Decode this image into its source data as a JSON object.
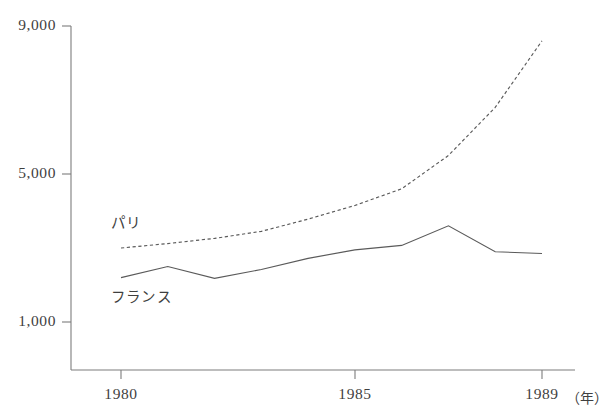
{
  "chart_data": {
    "type": "line",
    "title": "",
    "xlabel": "（年）",
    "ylabel": "",
    "x": [
      1980,
      1981,
      1982,
      1983,
      1984,
      1985,
      1986,
      1987,
      1988,
      1989
    ],
    "xlim": [
      1979.0,
      1990.0
    ],
    "ylim": [
      0,
      9000
    ],
    "yticks": [
      1000,
      5000,
      9000
    ],
    "ytick_labels": [
      "1,000",
      "5,000",
      "9,000"
    ],
    "xticks": [
      1980,
      1985,
      1989
    ],
    "xtick_labels": [
      "1980",
      "1985",
      "1989"
    ],
    "grid": false,
    "legend_position": "inline-annotations",
    "series": [
      {
        "name": "パリ",
        "style": "dashed",
        "color": "#5a5a5a",
        "label_annotation": "パリ",
        "values": [
          3000,
          3120,
          3260,
          3450,
          3780,
          4150,
          4600,
          5500,
          6800,
          8600
        ]
      },
      {
        "name": "フランス",
        "style": "solid",
        "color": "#5a5a5a",
        "label_annotation": "フランス",
        "values": [
          2200,
          2500,
          2180,
          2420,
          2720,
          2950,
          3070,
          3600,
          2900,
          2850
        ]
      }
    ]
  },
  "annotations": {
    "paris_label": "パリ",
    "france_label": "フランス",
    "year_unit": "（年）"
  }
}
